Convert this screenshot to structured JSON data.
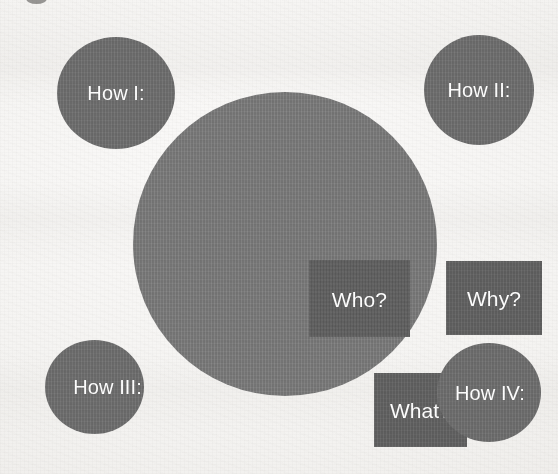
{
  "canvas": {
    "width": 558,
    "height": 474,
    "background_color": "#f3f2f0",
    "description": "Scanned page showing a circular SmartArt-style diagram"
  },
  "colors": {
    "page_background": "#f3f2f0",
    "center_circle_fill": "#7b7b7b",
    "inner_square_fill": "#636363",
    "corner_circle_fill": "#6f6f6f",
    "text_color": "#ffffff",
    "top_edge_mark": "#5f5d5b"
  },
  "diagram": {
    "center_circle": {
      "label": "",
      "inner_squares": [
        {
          "id": "who",
          "label": "Who?"
        },
        {
          "id": "why",
          "label": "Why?"
        },
        {
          "id": "what",
          "label": "What?"
        }
      ]
    },
    "corner_circles": [
      {
        "id": "how-1",
        "label": "How I:",
        "position": "top-left"
      },
      {
        "id": "how-2",
        "label": "How II:",
        "position": "top-right"
      },
      {
        "id": "how-3",
        "label": "How III:",
        "position": "bottom-left"
      },
      {
        "id": "how-4",
        "label": "How IV:",
        "position": "bottom-right"
      }
    ]
  }
}
